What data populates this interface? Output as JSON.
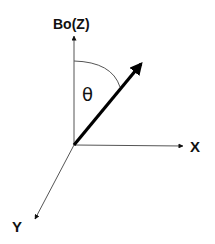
{
  "diagram": {
    "labels": {
      "z_axis": "Bo(Z)",
      "x_axis": "X",
      "y_axis": "Y",
      "angle": "θ"
    },
    "colors": {
      "axis": "#555555",
      "vector": "#000000",
      "text": "#111111",
      "background": "#ffffff"
    },
    "geometry": {
      "origin": [
        74,
        145
      ],
      "z_tip": [
        74,
        35
      ],
      "x_tip": [
        183,
        146
      ],
      "y_tip": [
        34,
        220
      ],
      "vector_tip": [
        143,
        62
      ]
    }
  }
}
